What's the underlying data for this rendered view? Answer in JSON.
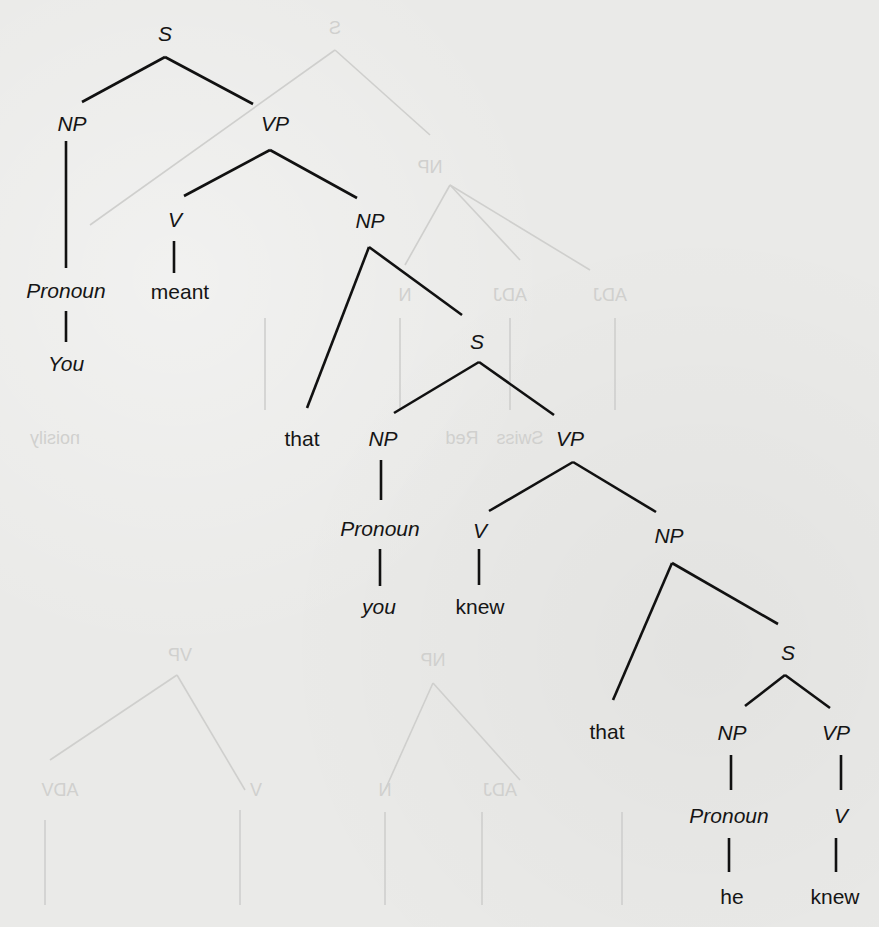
{
  "diagram": {
    "type": "syntax-tree",
    "sentence": "You meant that you knew that he knew",
    "colors": {
      "ink": "#111111",
      "paper": "#eaeae8",
      "bleed_through": "#cfcfcd"
    },
    "nodes": {
      "s1": "S",
      "np1": "NP",
      "vp1": "VP",
      "pron1": "Pronoun",
      "you1": "You",
      "v1": "V",
      "meant": "meant",
      "np2": "NP",
      "that1": "that",
      "s2": "S",
      "np3": "NP",
      "pron2": "Pronoun",
      "you2": "you",
      "vp2": "VP",
      "v2": "V",
      "knew1": "knew",
      "np4": "NP",
      "that2": "that",
      "s3": "S",
      "np5": "NP",
      "pron3": "Pronoun",
      "he": "he",
      "vp3": "VP",
      "v3": "V",
      "knew2": "knew"
    },
    "edges": [
      [
        "S",
        "NP"
      ],
      [
        "S",
        "VP"
      ],
      [
        "NP",
        "Pronoun"
      ],
      [
        "Pronoun",
        "You"
      ],
      [
        "VP",
        "V"
      ],
      [
        "VP",
        "NP"
      ],
      [
        "V",
        "meant"
      ],
      [
        "NP",
        "that"
      ],
      [
        "NP",
        "S"
      ],
      [
        "S",
        "NP"
      ],
      [
        "S",
        "VP"
      ],
      [
        "NP",
        "Pronoun"
      ],
      [
        "Pronoun",
        "you"
      ],
      [
        "VP",
        "V"
      ],
      [
        "VP",
        "NP"
      ],
      [
        "V",
        "knew"
      ],
      [
        "NP",
        "that"
      ],
      [
        "NP",
        "S"
      ],
      [
        "S",
        "NP"
      ],
      [
        "S",
        "VP"
      ],
      [
        "NP",
        "Pronoun"
      ],
      [
        "Pronoun",
        "he"
      ],
      [
        "VP",
        "V"
      ],
      [
        "V",
        "knew"
      ]
    ],
    "bleed_through_labels": [
      "S",
      "VP",
      "NP",
      "V",
      "N",
      "ADJ",
      "ADJ",
      "ADV",
      "Red",
      "Swiss",
      "piece",
      "stick",
      "noisily"
    ]
  }
}
